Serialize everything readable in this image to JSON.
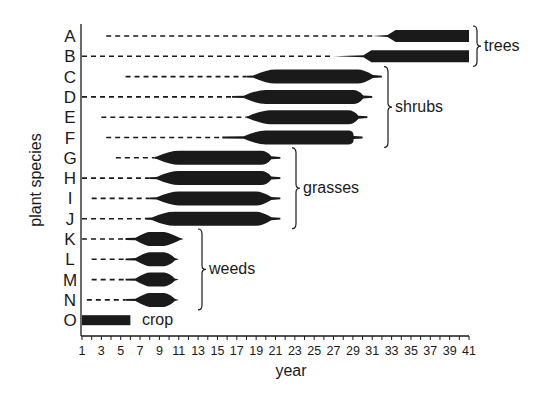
{
  "chart_data": {
    "type": "bar",
    "subtype": "succession-range-chart",
    "title": "",
    "xlabel": "year",
    "ylabel": "plant species",
    "xlim": [
      1,
      41
    ],
    "x_tick_labels": [
      "1",
      "3",
      "5",
      "7",
      "9",
      "11",
      "13",
      "15",
      "17",
      "19",
      "21",
      "23",
      "25",
      "27",
      "29",
      "31",
      "33",
      "35",
      "37",
      "39",
      "41"
    ],
    "x_minor_ticks_every": 1,
    "grid": false,
    "legend": "none (groups labeled with braces on right)",
    "encoding": "dashed line = species present at low abundance; thin line = increasing; thick band = dominant period; tapered ends = rise/decline",
    "categories": [
      "A",
      "B",
      "C",
      "D",
      "E",
      "F",
      "G",
      "H",
      "I",
      "J",
      "K",
      "L",
      "M",
      "N",
      "O"
    ],
    "series": [
      {
        "species": "A",
        "group": "trees",
        "dash_start": 3.5,
        "thin_start": 31.0,
        "peak_start": 33.0,
        "peak_end": 41.0,
        "end": 41.0,
        "shape": "open-ended"
      },
      {
        "species": "B",
        "group": "trees",
        "dash_start": 1.0,
        "thin_start": 27.0,
        "peak_start": 30.5,
        "peak_end": 41.0,
        "end": 41.0,
        "shape": "open-ended"
      },
      {
        "species": "C",
        "group": "shrubs",
        "dash_start": 5.5,
        "thin_start": 18.0,
        "peak_start": 21.0,
        "peak_end": 29.5,
        "end": 32.0,
        "shape": "spindle"
      },
      {
        "species": "D",
        "group": "shrubs",
        "dash_start": 1.0,
        "thin_start": 16.5,
        "peak_start": 20.0,
        "peak_end": 29.0,
        "end": 31.0,
        "shape": "spindle"
      },
      {
        "species": "E",
        "group": "shrubs",
        "dash_start": 3.0,
        "thin_start": 18.0,
        "peak_start": 20.5,
        "peak_end": 28.5,
        "end": 30.5,
        "shape": "spindle"
      },
      {
        "species": "F",
        "group": "shrubs",
        "dash_start": 3.5,
        "thin_start": 15.5,
        "peak_start": 20.0,
        "peak_end": 28.5,
        "end": 30.0,
        "shape": "spindle"
      },
      {
        "species": "G",
        "group": "grasses",
        "dash_start": 4.5,
        "thin_start": 8.5,
        "peak_start": 11.0,
        "peak_end": 19.5,
        "end": 21.5,
        "shape": "spindle"
      },
      {
        "species": "H",
        "group": "grasses",
        "dash_start": 1.0,
        "thin_start": 8.0,
        "peak_start": 11.0,
        "peak_end": 19.5,
        "end": 21.5,
        "shape": "spindle"
      },
      {
        "species": "I",
        "group": "grasses",
        "dash_start": 2.0,
        "thin_start": 8.0,
        "peak_start": 11.0,
        "peak_end": 19.0,
        "end": 21.5,
        "shape": "spindle"
      },
      {
        "species": "J",
        "group": "grasses",
        "dash_start": 1.0,
        "thin_start": 7.5,
        "peak_start": 10.5,
        "peak_end": 19.0,
        "end": 21.5,
        "shape": "spindle"
      },
      {
        "species": "K",
        "group": "weeds",
        "dash_start": 1.0,
        "thin_start": 5.5,
        "peak_start": 8.0,
        "peak_end": 9.5,
        "end": 11.5,
        "shape": "diamond"
      },
      {
        "species": "L",
        "group": "weeds",
        "dash_start": 2.0,
        "thin_start": 5.5,
        "peak_start": 8.0,
        "peak_end": 9.5,
        "end": 11.0,
        "shape": "diamond"
      },
      {
        "species": "M",
        "group": "weeds",
        "dash_start": 2.0,
        "thin_start": 5.5,
        "peak_start": 8.0,
        "peak_end": 9.5,
        "end": 11.0,
        "shape": "diamond"
      },
      {
        "species": "N",
        "group": "weeds",
        "dash_start": 1.5,
        "thin_start": 5.5,
        "peak_start": 8.0,
        "peak_end": 9.5,
        "end": 11.0,
        "shape": "diamond"
      },
      {
        "species": "O",
        "group": "crop",
        "dash_start": null,
        "thin_start": null,
        "peak_start": 1.0,
        "peak_end": 6.0,
        "end": 6.0,
        "shape": "solid-bar"
      }
    ],
    "groups": [
      {
        "label": "trees",
        "species": [
          "A",
          "B"
        ]
      },
      {
        "label": "shrubs",
        "species": [
          "C",
          "D",
          "E",
          "F"
        ]
      },
      {
        "label": "grasses",
        "species": [
          "G",
          "H",
          "I",
          "J"
        ]
      },
      {
        "label": "weeds",
        "species": [
          "K",
          "L",
          "M",
          "N"
        ]
      },
      {
        "label": "crop",
        "species": [
          "O"
        ]
      }
    ]
  },
  "labels": {
    "ylabel": "plant species",
    "xlabel": "year",
    "groups": {
      "trees": "trees",
      "shrubs": "shrubs",
      "grasses": "grasses",
      "weeds": "weeds",
      "crop": "crop"
    }
  },
  "colors": {
    "ink": "#1a1a1a",
    "background": "#ffffff"
  }
}
